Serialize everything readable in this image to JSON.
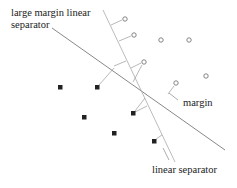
{
  "labels": {
    "large_margin_line1": "large margin linear",
    "large_margin_line2": "separator",
    "margin": "margin",
    "linear_separator": "linear separator"
  },
  "colors": {
    "line": "#888888",
    "thin_line": "#aaaaaa",
    "square": "#222222",
    "circle": "#777777",
    "text": "#222222"
  },
  "points": {
    "circles": [
      {
        "x": 125,
        "y": 19
      },
      {
        "x": 134,
        "y": 35
      },
      {
        "x": 161,
        "y": 40
      },
      {
        "x": 189,
        "y": 40
      },
      {
        "x": 144,
        "y": 62
      },
      {
        "x": 206,
        "y": 76
      },
      {
        "x": 176,
        "y": 83
      }
    ],
    "squares": [
      {
        "x": 60,
        "y": 87
      },
      {
        "x": 97,
        "y": 87
      },
      {
        "x": 84,
        "y": 117
      },
      {
        "x": 133,
        "y": 113
      },
      {
        "x": 114,
        "y": 133
      },
      {
        "x": 154,
        "y": 141
      }
    ]
  },
  "lines": {
    "large_margin_separator": {
      "x1": 52,
      "y1": 28,
      "x2": 225,
      "y2": 150
    },
    "linear_separator": {
      "x1": 103,
      "y1": 10,
      "x2": 175,
      "y2": 162
    }
  }
}
